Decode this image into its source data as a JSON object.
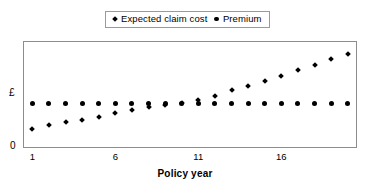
{
  "legend": {
    "position": "top-center",
    "entries": [
      {
        "label": "Expected claim cost",
        "marker": "diamond-marker-icon",
        "color": "#000000"
      },
      {
        "label": "Premium",
        "marker": "dot-marker-icon",
        "color": "#000000"
      }
    ]
  },
  "axes": {
    "y_label": "£",
    "y_zero_label": "0",
    "x_title": "Policy year",
    "x_ticks": [
      "1",
      "6",
      "11",
      "16"
    ]
  },
  "chart_data": {
    "type": "scatter",
    "title": "",
    "subtitle": "",
    "xlabel": "Policy year",
    "ylabel": "£",
    "grid": false,
    "legend_position": "top-center",
    "x": [
      1,
      2,
      3,
      4,
      5,
      6,
      7,
      8,
      9,
      10,
      11,
      12,
      13,
      14,
      15,
      16,
      17,
      18,
      19,
      20
    ],
    "xlim": [
      0.5,
      20.5
    ],
    "ylim": [
      0,
      100
    ],
    "x_tick_labels": [
      "1",
      "6",
      "11",
      "16"
    ],
    "x_tick_values": [
      1,
      6,
      11,
      16
    ],
    "y_tick_labels": [
      "0",
      "£"
    ],
    "series": [
      {
        "name": "Expected claim cost",
        "marker": "diamond",
        "color": "#000000",
        "values": [
          17,
          21,
          24,
          26,
          29,
          32,
          35,
          38,
          40,
          42,
          45,
          49,
          54,
          58,
          63,
          68,
          73,
          78,
          84,
          89
        ]
      },
      {
        "name": "Premium",
        "marker": "circle",
        "color": "#000000",
        "values": [
          41,
          41,
          41,
          41,
          41,
          41,
          41,
          41,
          41,
          41,
          41,
          41,
          41,
          41,
          41,
          41,
          41,
          41,
          41,
          41
        ]
      }
    ]
  }
}
